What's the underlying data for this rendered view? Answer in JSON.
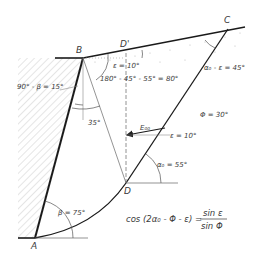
{
  "points": {
    "A": "A",
    "B": "B",
    "C": "C",
    "D": "D",
    "D_prime": "D'"
  },
  "angle_labels": {
    "epsilon_top": "ε = 10°",
    "sum_angle": "180° - 45° - 55° = 80°",
    "complement_beta": "90° - β = 15°",
    "angle_35": "35°",
    "alpha_minus_eps": "α₀ - ε = 45°",
    "phi": "Φ = 30°",
    "e_force": "E₀₀",
    "epsilon_force": "ε = 10°",
    "alpha0": "α₀ = 55°",
    "beta": "β = 75°"
  },
  "equation": {
    "lhs": "cos (2α₀ - Φ - ε) =",
    "numerator": "sin ε",
    "denominator": "sin Φ"
  },
  "colors": {
    "line": "#1a1a1a",
    "thin": "#555555",
    "text": "#3a3a3a",
    "dots": "#bbbbbb"
  }
}
